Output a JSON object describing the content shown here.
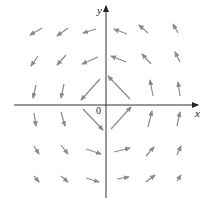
{
  "figure": {
    "axes": {
      "x_label": "x",
      "y_label": "y",
      "origin_label": "0",
      "origin_px": [
        106,
        105
      ],
      "axis_color": "#333333"
    },
    "arrow_color": "#8a8a8a",
    "arrows": [
      {
        "tail": [
          42,
          28
        ],
        "head": [
          30,
          35
        ]
      },
      {
        "tail": [
          68,
          28
        ],
        "head": [
          57,
          36
        ]
      },
      {
        "tail": [
          96,
          29
        ],
        "head": [
          83,
          33
        ]
      },
      {
        "tail": [
          127,
          34
        ],
        "head": [
          114,
          29
        ]
      },
      {
        "tail": [
          148,
          33
        ],
        "head": [
          139,
          25
        ]
      },
      {
        "tail": [
          178,
          33
        ],
        "head": [
          173,
          24
        ]
      },
      {
        "tail": [
          38,
          56
        ],
        "head": [
          31,
          66
        ]
      },
      {
        "tail": [
          66,
          55
        ],
        "head": [
          57,
          65
        ]
      },
      {
        "tail": [
          98,
          57
        ],
        "head": [
          82,
          64
        ]
      },
      {
        "tail": [
          126,
          62
        ],
        "head": [
          111,
          56
        ]
      },
      {
        "tail": [
          151,
          64
        ],
        "head": [
          142,
          54
        ]
      },
      {
        "tail": [
          180,
          62
        ],
        "head": [
          175,
          52
        ]
      },
      {
        "tail": [
          36,
          85
        ],
        "head": [
          33,
          98
        ]
      },
      {
        "tail": [
          64,
          84
        ],
        "head": [
          61,
          98
        ]
      },
      {
        "tail": [
          100,
          79
        ],
        "head": [
          81,
          100
        ]
      },
      {
        "tail": [
          130,
          99
        ],
        "head": [
          108,
          76
        ]
      },
      {
        "tail": [
          153,
          96
        ],
        "head": [
          150,
          80
        ]
      },
      {
        "tail": [
          180,
          96
        ],
        "head": [
          178,
          82
        ]
      },
      {
        "tail": [
          34,
          113
        ],
        "head": [
          36,
          126
        ]
      },
      {
        "tail": [
          61,
          112
        ],
        "head": [
          65,
          126
        ]
      },
      {
        "tail": [
          83,
          109
        ],
        "head": [
          103,
          130
        ]
      },
      {
        "tail": [
          111,
          129
        ],
        "head": [
          131,
          107
        ]
      },
      {
        "tail": [
          148,
          127
        ],
        "head": [
          152,
          111
        ]
      },
      {
        "tail": [
          177,
          126
        ],
        "head": [
          180,
          112
        ]
      },
      {
        "tail": [
          34,
          146
        ],
        "head": [
          39,
          154
        ]
      },
      {
        "tail": [
          61,
          145
        ],
        "head": [
          68,
          154
        ]
      },
      {
        "tail": [
          86,
          149
        ],
        "head": [
          101,
          154
        ]
      },
      {
        "tail": [
          114,
          152
        ],
        "head": [
          130,
          148
        ]
      },
      {
        "tail": [
          146,
          156
        ],
        "head": [
          154,
          147
        ]
      },
      {
        "tail": [
          177,
          155
        ],
        "head": [
          181,
          146
        ]
      },
      {
        "tail": [
          34,
          176
        ],
        "head": [
          39,
          182
        ]
      },
      {
        "tail": [
          61,
          176
        ],
        "head": [
          68,
          182
        ]
      },
      {
        "tail": [
          86,
          178
        ],
        "head": [
          99,
          182
        ]
      },
      {
        "tail": [
          117,
          179
        ],
        "head": [
          129,
          177
        ]
      },
      {
        "tail": [
          146,
          182
        ],
        "head": [
          155,
          175
        ]
      },
      {
        "tail": [
          177,
          181
        ],
        "head": [
          181,
          175
        ]
      }
    ]
  }
}
